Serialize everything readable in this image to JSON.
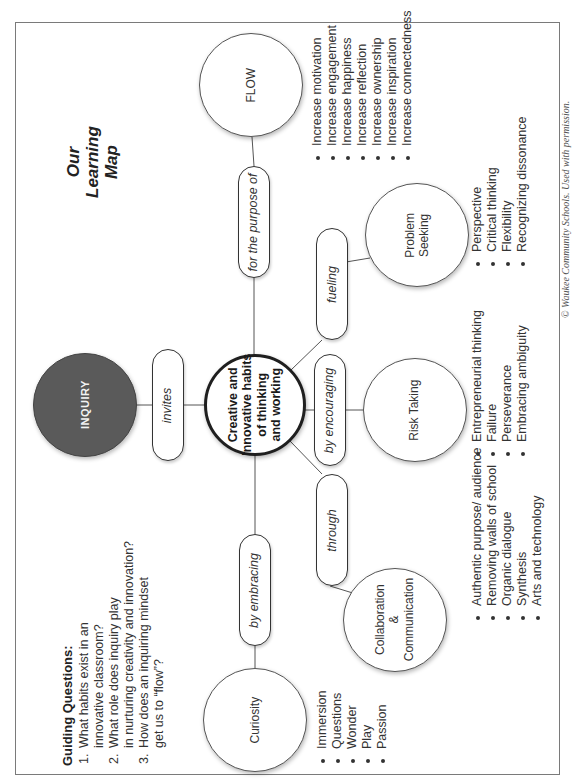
{
  "title": {
    "lines": [
      "Our",
      "Learning",
      "Map"
    ]
  },
  "guiding_questions": {
    "title": "Guiding Questions:",
    "items": [
      {
        "num": "1.",
        "lines": [
          "What habits exist in an",
          "innovative classroom?"
        ]
      },
      {
        "num": "2.",
        "lines": [
          "What role does inquiry play",
          "in nurturing creativity and innovation?"
        ]
      },
      {
        "num": "3.",
        "lines": [
          "How does an inquiring mindset",
          "get us to “flow”?"
        ]
      }
    ]
  },
  "nodes": {
    "inquiry": "INQUIRY",
    "center": [
      "Creative and",
      "Innovative habits",
      "of thinking",
      "and working"
    ],
    "flow": "FLOW",
    "curiosity": "Curiosity",
    "collaboration": [
      "Collaboration",
      "&",
      "Communication"
    ],
    "risk_taking": "Risk Taking",
    "problem_seeking": [
      "Problem",
      "Seeking"
    ]
  },
  "connectors": {
    "invites": "invites",
    "for_the_purpose_of": "for the purpose of",
    "by_embracing": "by embracing",
    "through": "through",
    "by_encouraging": "by encouraging",
    "fueling": "fueling"
  },
  "lists": {
    "flow": [
      "Increase motivation",
      "Increase engagement",
      "Increase happiness",
      "Increase reflection",
      "Increase ownership",
      "Increase inspiration",
      "Increase connectedness"
    ],
    "curiosity": [
      "Immersion",
      "Questions",
      "Wonder",
      "Play",
      "Passion"
    ],
    "collaboration": [
      "Authentic purpose/ audience",
      "Removing walls of school",
      "Organic dialogue",
      "Synthesis",
      "Arts and technology"
    ],
    "risk_taking": [
      "Entrepreneurial thinking",
      "Failure",
      "Perseverance",
      "Embracing ambiguity"
    ],
    "problem_seeking": [
      "Perspective",
      "Critical thinking",
      "Flexibility",
      "Recognizing dissonance"
    ]
  },
  "copyright": "© Waukee Community Schools. Used with permission.",
  "colors": {
    "inquiry_fill": "#5a5a5a",
    "border": "#7a7a7a",
    "text": "#333333"
  }
}
